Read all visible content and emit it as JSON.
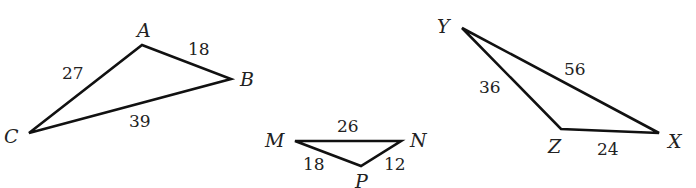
{
  "diagram": {
    "type": "similar-triangles-figure",
    "triangles": [
      {
        "id": "ABC",
        "vertices": [
          {
            "label": "A",
            "x": 142,
            "y": 45,
            "label_x": 137,
            "label_y": 37
          },
          {
            "label": "B",
            "x": 231,
            "y": 79,
            "label_x": 240,
            "label_y": 86
          },
          {
            "label": "C",
            "x": 29,
            "y": 133,
            "label_x": 4,
            "label_y": 143
          }
        ],
        "sides": [
          {
            "between": "AC",
            "length": "27",
            "label_x": 62,
            "label_y": 79
          },
          {
            "between": "AB",
            "length": "18",
            "label_x": 188,
            "label_y": 55
          },
          {
            "between": "BC",
            "length": "39",
            "label_x": 129,
            "label_y": 127
          }
        ]
      },
      {
        "id": "MNP",
        "vertices": [
          {
            "label": "M",
            "x": 295,
            "y": 141,
            "label_x": 265,
            "label_y": 147
          },
          {
            "label": "N",
            "x": 401,
            "y": 141,
            "label_x": 410,
            "label_y": 147
          },
          {
            "label": "P",
            "x": 361,
            "y": 166,
            "label_x": 355,
            "label_y": 188
          }
        ],
        "sides": [
          {
            "between": "MN",
            "length": "26",
            "label_x": 337,
            "label_y": 132
          },
          {
            "between": "MP",
            "length": "18",
            "label_x": 303,
            "label_y": 170
          },
          {
            "between": "NP",
            "length": "12",
            "label_x": 384,
            "label_y": 170
          }
        ]
      },
      {
        "id": "XYZ",
        "vertices": [
          {
            "label": "Y",
            "x": 462,
            "y": 28,
            "label_x": 437,
            "label_y": 33
          },
          {
            "label": "Z",
            "x": 561,
            "y": 129,
            "label_x": 548,
            "label_y": 153
          },
          {
            "label": "X",
            "x": 659,
            "y": 133,
            "label_x": 668,
            "label_y": 148
          }
        ],
        "sides": [
          {
            "between": "YZ",
            "length": "36",
            "label_x": 479,
            "label_y": 93
          },
          {
            "between": "YX",
            "length": "56",
            "label_x": 564,
            "label_y": 75
          },
          {
            "between": "ZX",
            "length": "24",
            "label_x": 597,
            "label_y": 155
          }
        ]
      }
    ]
  }
}
